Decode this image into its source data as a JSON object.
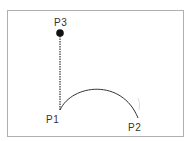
{
  "diagram": {
    "frame": {
      "x": 7,
      "y": 10,
      "w": 176,
      "h": 126,
      "stroke": "#b0b0b0"
    },
    "points": [
      {
        "id": "p1",
        "label": "P1",
        "x": 60,
        "y": 110,
        "label_x": 46,
        "label_y": 123
      },
      {
        "id": "p2",
        "label": "P2",
        "x": 138,
        "y": 118,
        "label_x": 128,
        "label_y": 131
      },
      {
        "id": "p3",
        "label": "P3",
        "x": 60,
        "y": 33,
        "label_x": 54,
        "label_y": 26
      }
    ],
    "colors": {
      "line": "#333333",
      "dot": "#111111",
      "text": "#333333"
    }
  }
}
